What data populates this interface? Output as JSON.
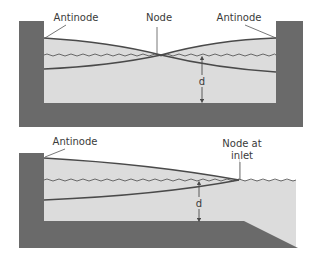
{
  "colors": {
    "wall": "#6a6a6a",
    "water": "#dcdcdc",
    "line": "#4a4a4a",
    "leader": "#555555",
    "background": "#ffffff"
  },
  "top_diagram": {
    "label_antinode_left": "Antinode",
    "label_node": "Node",
    "label_antinode_right": "Antinode",
    "label_depth": "d"
  },
  "bottom_diagram": {
    "label_antinode": "Antinode",
    "label_node_line1": "Node at",
    "label_node_line2": "inlet",
    "label_depth": "d"
  }
}
